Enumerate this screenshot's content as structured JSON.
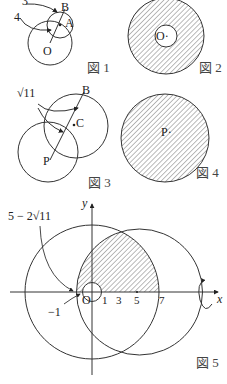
{
  "figures": [
    {
      "id": "fig1",
      "caption": "図 1",
      "labels": {
        "b": "B",
        "a": "A",
        "o": "O",
        "r1": "3",
        "r2": "4"
      }
    },
    {
      "id": "fig2",
      "caption": "図 2",
      "labels": {
        "o": "O·"
      }
    },
    {
      "id": "fig3",
      "caption": "図 3",
      "labels": {
        "b": "B",
        "c": "C",
        "p": "P",
        "radius": "√11"
      }
    },
    {
      "id": "fig4",
      "caption": "図 4",
      "labels": {
        "p": "P·"
      }
    },
    {
      "id": "fig5",
      "caption": "図 5",
      "labels": {
        "y_axis": "y",
        "x_axis": "x",
        "origin": "O",
        "annot_top": "5 − 2√11",
        "annot_neg": "−1",
        "ticks": [
          "1",
          "3",
          "5",
          "7"
        ]
      }
    }
  ],
  "colors": {
    "line": "#333333",
    "hatch": "#555555",
    "background": "#ffffff"
  }
}
